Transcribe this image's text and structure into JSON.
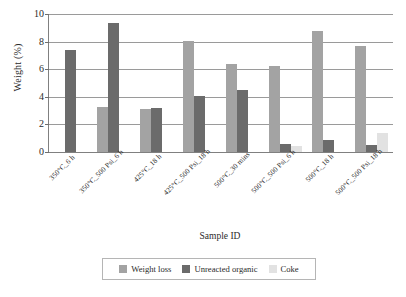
{
  "chart_data": {
    "type": "bar",
    "title": "",
    "xlabel": "Sample ID",
    "ylabel": "Weight (%)",
    "ylim": [
      0,
      10
    ],
    "yticks": [
      0,
      2,
      4,
      6,
      8,
      10
    ],
    "ytick_labels": [
      "0",
      "2",
      "4",
      "6",
      "8",
      "10"
    ],
    "grid": true,
    "legend_position": "bottom",
    "categories": [
      "350°C_6 h",
      "350°C_500 Psi_6 h",
      "425°C_18 h",
      "425°C_500 Psi_18 h",
      "500°C_30 mins",
      "500°C_500 Psi_6 h",
      "500°C_18 h",
      "500°C_500 Psi_18 h"
    ],
    "series": [
      {
        "name": "Weight loss",
        "color": "#a3a3a3",
        "values": [
          null,
          3.25,
          3.1,
          8.05,
          6.4,
          6.2,
          8.8,
          7.7
        ]
      },
      {
        "name": "Unreacted organic",
        "color": "#6b6b6b",
        "values": [
          7.4,
          9.35,
          3.2,
          4.05,
          4.5,
          0.55,
          0.9,
          0.5
        ]
      },
      {
        "name": "Coke",
        "color": "#e2e2e2",
        "values": [
          null,
          null,
          null,
          null,
          null,
          0.4,
          null,
          1.35
        ]
      }
    ]
  },
  "axes": {
    "y_title": "Weight (%)",
    "x_title": "Sample ID"
  },
  "legend": {
    "items": [
      {
        "label": "Weight loss",
        "color": "#a3a3a3"
      },
      {
        "label": "Unreacted organic",
        "color": "#6b6b6b"
      },
      {
        "label": "Coke",
        "color": "#e2e2e2"
      }
    ]
  }
}
